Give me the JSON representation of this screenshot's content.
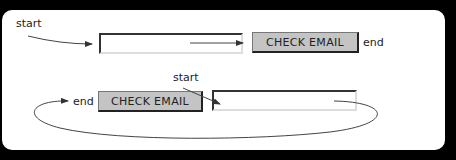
{
  "diagram": {
    "top_row": {
      "start_label": "start",
      "end_label": "end",
      "button_label": "CHECK EMAIL",
      "field_value": ""
    },
    "bottom_row": {
      "start_label": "start",
      "end_label": "end",
      "button_label": "CHECK EMAIL",
      "field_value": ""
    },
    "colors": {
      "background": "#000000",
      "panel": "#ffffff",
      "button_fill": "#c4c4c4",
      "stroke": "#333333"
    }
  }
}
